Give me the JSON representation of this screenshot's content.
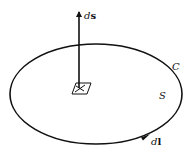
{
  "diagram": {
    "labels": {
      "normal_vector": "ds",
      "normal_vector_d": "d",
      "normal_vector_s": "s",
      "curve": "C",
      "surface": "S",
      "line_element": "dl",
      "line_element_d": "d",
      "line_element_l": "l"
    },
    "colors": {
      "stroke": "#111111",
      "background": "#ffffff"
    }
  }
}
